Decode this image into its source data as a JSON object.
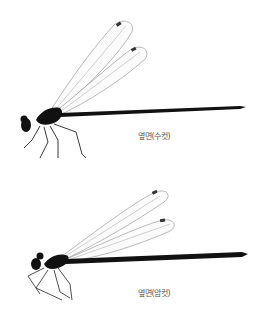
{
  "figure": {
    "specimens": [
      {
        "id": "male",
        "label": "옆면(수컷)",
        "description": "side view of male damselfly"
      },
      {
        "id": "female",
        "label": "옆면(암컷)",
        "description": "side view of female damselfly"
      }
    ],
    "colors": {
      "background": "#ffffff",
      "body": "#111111",
      "wing_vein": "#8a8a8a",
      "label_text": "#555555"
    }
  }
}
